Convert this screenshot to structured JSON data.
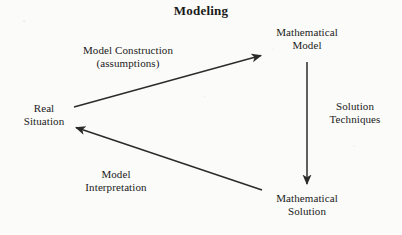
{
  "title": "Modeling",
  "nodes": [
    {
      "id": "real-situation",
      "label": "Real\nSituation"
    },
    {
      "id": "mathematical-model",
      "label": "Mathematical\nModel"
    },
    {
      "id": "mathematical-solution",
      "label": "Mathematical\nSolution"
    }
  ],
  "edges": [
    {
      "id": "model-construction",
      "label": "Model Construction\n(assumptions)",
      "from": "real-situation",
      "to": "mathematical-model"
    },
    {
      "id": "solution-techniques",
      "label": "Solution\nTechniques",
      "from": "mathematical-model",
      "to": "mathematical-solution"
    },
    {
      "id": "model-interpretation",
      "label": "Model\nInterpretation",
      "from": "mathematical-solution",
      "to": "real-situation"
    }
  ],
  "colors": {
    "background": "#fbfbf9",
    "ink": "#1a1a1a",
    "arrow": "#2b2b2b"
  },
  "diagram": {
    "type": "cycle",
    "arrows": [
      {
        "id": "arrow-model-construction",
        "x1": 74,
        "y1": 107,
        "x2": 263,
        "y2": 55
      },
      {
        "id": "arrow-solution-techniques",
        "x1": 307,
        "y1": 62,
        "x2": 307,
        "y2": 186
      },
      {
        "id": "arrow-model-interpretation",
        "x1": 262,
        "y1": 190,
        "x2": 74,
        "y2": 127
      }
    ]
  }
}
